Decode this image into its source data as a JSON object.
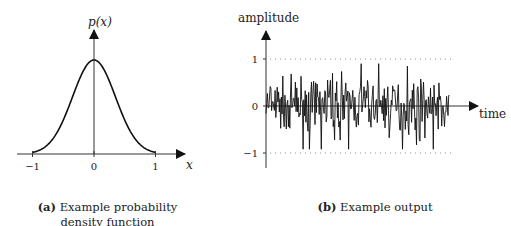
{
  "chart_data": [
    {
      "type": "line",
      "title": "Example probability density function",
      "caption_label": "(a)",
      "caption_text": "Example probability density function",
      "xlabel": "x",
      "ylabel": "p(x)",
      "x_ticks": [
        "-1",
        "0",
        "1"
      ],
      "xlim": [
        -1,
        1
      ],
      "curve": "gaussian",
      "mean": 0,
      "std": 0.35,
      "peak": 1.0
    },
    {
      "type": "line",
      "title": "Example output",
      "caption_label": "(b)",
      "caption_text": "Example output",
      "xlabel": "time",
      "ylabel": "amplitude",
      "y_ticks": [
        "1",
        "0",
        "-1"
      ],
      "ylim": [
        -1,
        1
      ],
      "reference_lines": [
        1,
        -1
      ],
      "series": "random noise signal, roughly within [-0.9, 0.9]"
    }
  ]
}
